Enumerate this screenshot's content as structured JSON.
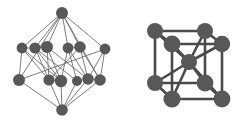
{
  "figure": {
    "background_color": "#ffffff",
    "node_color": "#585858",
    "edge_color_thin": "#6e6e6e",
    "edge_color_thick": "#4a4a4a",
    "panel_count": 2
  },
  "chart_data": {
    "type": "diagram",
    "subtitle": "",
    "xlabel": "",
    "ylabel": "",
    "grid": false,
    "legend": "none",
    "xlim": [
      0,
      247
    ],
    "ylim": [
      0,
      124
    ],
    "graphs": [
      {
        "name": "layered-bipyramid-graph",
        "label": "left",
        "node_count": 14,
        "edge_count": 36,
        "node_radius": 5.4,
        "edge_width": 0.9,
        "node_color": "#585858",
        "edge_color": "#6e6e6e",
        "nodes": [
          {
            "id": "t",
            "x": 62,
            "y": 13,
            "r": 6.0,
            "layer": "top-apex"
          },
          {
            "id": "u0",
            "x": 22,
            "y": 48,
            "r": 5.4,
            "layer": "upper"
          },
          {
            "id": "u1",
            "x": 35,
            "y": 48,
            "r": 5.6,
            "layer": "upper"
          },
          {
            "id": "u2",
            "x": 47,
            "y": 47,
            "r": 6.0,
            "layer": "upper"
          },
          {
            "id": "u3",
            "x": 68,
            "y": 48,
            "r": 5.4,
            "layer": "upper"
          },
          {
            "id": "u4",
            "x": 80,
            "y": 47,
            "r": 5.8,
            "layer": "upper"
          },
          {
            "id": "u5",
            "x": 105,
            "y": 49,
            "r": 5.4,
            "layer": "upper"
          },
          {
            "id": "l0",
            "x": 19,
            "y": 80,
            "r": 6.0,
            "layer": "lower"
          },
          {
            "id": "l1",
            "x": 49,
            "y": 80,
            "r": 5.6,
            "layer": "lower"
          },
          {
            "id": "l2",
            "x": 61,
            "y": 81,
            "r": 6.2,
            "layer": "lower"
          },
          {
            "id": "l3",
            "x": 77,
            "y": 81,
            "r": 5.0,
            "layer": "lower"
          },
          {
            "id": "l4",
            "x": 88,
            "y": 79,
            "r": 5.8,
            "layer": "lower"
          },
          {
            "id": "l5",
            "x": 100,
            "y": 80,
            "r": 5.8,
            "layer": "lower"
          },
          {
            "id": "b",
            "x": 62,
            "y": 110,
            "r": 5.8,
            "layer": "bottom-apex"
          }
        ],
        "edges": [
          [
            "t",
            "u0"
          ],
          [
            "t",
            "u1"
          ],
          [
            "t",
            "u2"
          ],
          [
            "t",
            "u3"
          ],
          [
            "t",
            "u4"
          ],
          [
            "t",
            "u5"
          ],
          [
            "t",
            "l0"
          ],
          [
            "t",
            "l5"
          ],
          [
            "u0",
            "l0"
          ],
          [
            "u0",
            "l1"
          ],
          [
            "u0",
            "l2"
          ],
          [
            "u1",
            "l1"
          ],
          [
            "u1",
            "l2"
          ],
          [
            "u1",
            "l3"
          ],
          [
            "u2",
            "l1"
          ],
          [
            "u2",
            "l2"
          ],
          [
            "u2",
            "l4"
          ],
          [
            "u3",
            "l2"
          ],
          [
            "u3",
            "l3"
          ],
          [
            "u3",
            "l4"
          ],
          [
            "u4",
            "l1"
          ],
          [
            "u4",
            "l4"
          ],
          [
            "u4",
            "l5"
          ],
          [
            "u5",
            "l4"
          ],
          [
            "u5",
            "l5"
          ],
          [
            "u5",
            "l0"
          ],
          [
            "u0",
            "u1"
          ],
          [
            "u1",
            "u2"
          ],
          [
            "u3",
            "u4"
          ],
          [
            "l1",
            "l2"
          ],
          [
            "l4",
            "l5"
          ],
          [
            "b",
            "l0"
          ],
          [
            "b",
            "l1"
          ],
          [
            "b",
            "l2"
          ],
          [
            "b",
            "l3"
          ],
          [
            "b",
            "l4"
          ],
          [
            "b",
            "l5"
          ]
        ]
      },
      {
        "name": "body-centred-cubic-lattice",
        "label": "right",
        "node_count": 9,
        "edge_count": 20,
        "node_radius": 8.0,
        "edge_width": 2.6,
        "node_color": "#585858",
        "edge_color": "#4a4a4a",
        "nodes": [
          {
            "id": "fbl",
            "x": 155,
            "y": 83,
            "r": 8.0,
            "position": "front-bottom-left"
          },
          {
            "id": "fbr",
            "x": 205,
            "y": 83,
            "r": 8.4,
            "position": "front-bottom-right"
          },
          {
            "id": "ftl",
            "x": 155,
            "y": 31,
            "r": 8.0,
            "position": "front-top-left"
          },
          {
            "id": "ftr",
            "x": 205,
            "y": 31,
            "r": 8.0,
            "position": "front-top-right"
          },
          {
            "id": "rbl",
            "x": 172,
            "y": 99,
            "r": 8.6,
            "position": "rear-bottom-left"
          },
          {
            "id": "rbr",
            "x": 222,
            "y": 99,
            "r": 8.4,
            "position": "rear-bottom-right"
          },
          {
            "id": "rtl",
            "x": 172,
            "y": 44,
            "r": 8.4,
            "position": "rear-top-left"
          },
          {
            "id": "rtr",
            "x": 222,
            "y": 44,
            "r": 8.2,
            "position": "rear-top-right"
          },
          {
            "id": "ctr",
            "x": 189,
            "y": 62,
            "r": 8.0,
            "position": "body-centre"
          }
        ],
        "edges": [
          [
            "ftl",
            "ftr"
          ],
          [
            "ftr",
            "fbr"
          ],
          [
            "fbr",
            "fbl"
          ],
          [
            "fbl",
            "ftl"
          ],
          [
            "rtl",
            "rtr"
          ],
          [
            "rtr",
            "rbr"
          ],
          [
            "rbr",
            "rbl"
          ],
          [
            "rbl",
            "rtl"
          ],
          [
            "ftl",
            "rtl"
          ],
          [
            "ftr",
            "rtr"
          ],
          [
            "fbl",
            "rbl"
          ],
          [
            "fbr",
            "rbr"
          ],
          [
            "ctr",
            "ftl"
          ],
          [
            "ctr",
            "ftr"
          ],
          [
            "ctr",
            "fbl"
          ],
          [
            "ctr",
            "fbr"
          ],
          [
            "ctr",
            "rtl"
          ],
          [
            "ctr",
            "rtr"
          ],
          [
            "ctr",
            "rbl"
          ],
          [
            "ctr",
            "rbr"
          ]
        ]
      }
    ]
  }
}
